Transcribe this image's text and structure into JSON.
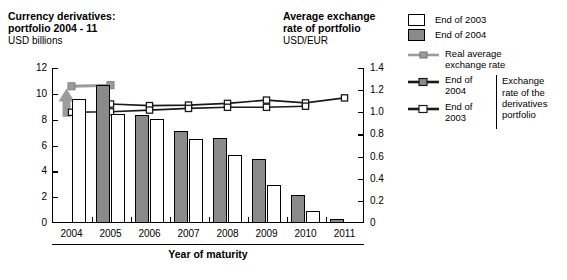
{
  "left_title": {
    "main": "Currency derivatives:\nportfolio 2004 - 11",
    "sub": "USD billions"
  },
  "right_title": {
    "main": "Average exchange\nrate of portfolio",
    "sub": "USD/EUR"
  },
  "legend": {
    "bars": [
      {
        "label": "End of 2003",
        "swatch": "white-square-swatch"
      },
      {
        "label": "End of 2004",
        "swatch": "gray-square-swatch"
      }
    ],
    "real_rate": {
      "label": "Real average\nexchange rate"
    },
    "portfolio_group": {
      "items": [
        {
          "label": "End of 2004"
        },
        {
          "label": "End of 2003"
        }
      ],
      "brace_label": "Exchange\nrate of the\nderivatives\nportfolio"
    }
  },
  "colors": {
    "bar_2003": "#ffffff",
    "bar_2004": "#8a8a8a",
    "line_2004": "#1a1a1a",
    "line_2003": "#1a1a1a",
    "real_rate": "#9c9c9c",
    "axis": "#000000"
  },
  "chart_data": {
    "type": "bar",
    "title": "Currency derivatives: portfolio 2004 - 11",
    "subtitle": "USD billions",
    "xlabel": "Year of maturity",
    "ylabel": "USD billions",
    "ylabel_right": "USD/EUR",
    "grid": false,
    "legend_position": "top-right",
    "categories": [
      "2004",
      "2005",
      "2006",
      "2007",
      "2008",
      "2009",
      "2010",
      "2011"
    ],
    "ylim": [
      0,
      12
    ],
    "yticks": [
      0,
      2,
      4,
      6,
      8,
      10,
      12
    ],
    "ylim_right": [
      0,
      1.4
    ],
    "yticks_right": [
      0,
      0.2,
      0.4,
      0.6,
      0.8,
      1.0,
      1.2,
      1.4
    ],
    "ytick_labels_right": [
      "0",
      "0.2",
      "0.4",
      "0.6",
      "0.8",
      "1.0",
      "1.2",
      "1.4"
    ],
    "series": [
      {
        "name": "End of 2004",
        "kind": "bar",
        "axis": "left",
        "color": "#8a8a8a",
        "values": [
          null,
          10.7,
          8.4,
          7.15,
          6.6,
          4.95,
          2.15,
          0.3
        ]
      },
      {
        "name": "End of 2003",
        "kind": "bar",
        "axis": "left",
        "color": "#ffffff",
        "values": [
          9.6,
          8.45,
          8.05,
          6.5,
          5.3,
          2.95,
          0.95,
          null
        ]
      },
      {
        "name": "Real average exchange rate",
        "kind": "line",
        "axis": "right",
        "color": "#9c9c9c",
        "x": [
          "2004",
          "2005"
        ],
        "values": [
          1.235,
          1.245
        ]
      },
      {
        "name": "End of 2004 (exchange rate of the derivatives portfolio)",
        "kind": "line",
        "axis": "right",
        "color": "#1a1a1a",
        "x": [
          "2005",
          "2006",
          "2007",
          "2008",
          "2009",
          "2010",
          "2011"
        ],
        "values": [
          1.075,
          1.06,
          1.065,
          1.08,
          1.11,
          1.085,
          1.13
        ]
      },
      {
        "name": "End of 2003 (exchange rate of the derivatives portfolio)",
        "kind": "line",
        "axis": "right",
        "color": "#1a1a1a",
        "x": [
          "2004",
          "2005",
          "2006",
          "2007",
          "2008",
          "2009",
          "2010"
        ],
        "values": [
          1.0,
          1.005,
          1.02,
          1.035,
          1.045,
          1.045,
          1.055
        ]
      }
    ],
    "annotations": [
      {
        "type": "arrow",
        "name": "gray-up-arrow",
        "x": "2004",
        "direction": "up"
      }
    ]
  }
}
